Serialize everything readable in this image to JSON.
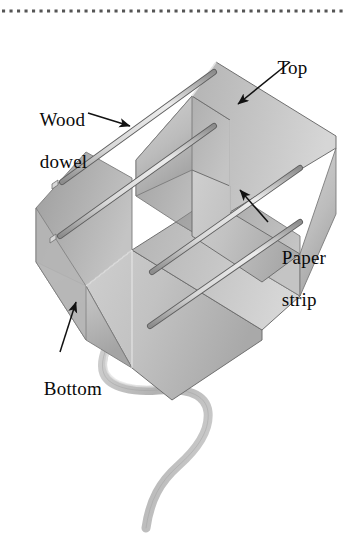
{
  "figure": {
    "background_color": "#ffffff",
    "rule": {
      "name": "dotted-rule",
      "style": "dotted",
      "color": "#555555",
      "y": 11,
      "dot_size": 3,
      "dot_spacing": 7.5
    },
    "labels": [
      {
        "id": "top",
        "line1": "Top",
        "line2": ""
      },
      {
        "id": "wood",
        "line1": "Wood",
        "line2": "dowel"
      },
      {
        "id": "paper",
        "line1": "Paper",
        "line2": "strip"
      },
      {
        "id": "bottom",
        "line1": "Bottom",
        "line2": ""
      }
    ],
    "colors": {
      "paper_light": "#d2d2d2",
      "paper_mid": "#bdbdbd",
      "paper_dark": "#a8a8a8",
      "paper_shadow": "#949494",
      "dowel_light": "#e2e2e2",
      "dowel_edge": "#6f6f6f",
      "tail": "#bcbcbc",
      "outline": "#6a6a6a",
      "arrow": "#121212",
      "text": "#0a0a0a"
    },
    "parts": {
      "top_band": "Top paper strip loop forming upper box band",
      "bottom_band": "Bottom paper strip loop forming lower box band",
      "dowels": "Four thin wood dowels spanning between the bands",
      "tail": "Wavy ribbon tail hanging from the bottom band"
    }
  }
}
